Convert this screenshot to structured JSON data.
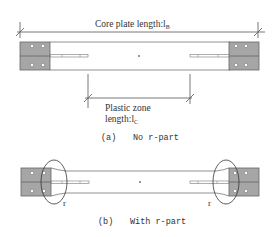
{
  "figure_a": {
    "dimension_top": {
      "label": "Core plate length:l",
      "subscript": "B"
    },
    "dimension_bottom": {
      "label_line1": "Plastic zone",
      "label_line2": "length:l",
      "subscript": "C"
    },
    "caption_letter": "(a)",
    "caption_text": "No r-part"
  },
  "figure_b": {
    "r_label_left": "r",
    "r_label_right": "r",
    "caption_letter": "(b)",
    "caption_text": "With r-part"
  },
  "colors": {
    "line": "#555555",
    "end_plate_fill": "#a6a6a6",
    "end_plate_stroke": "#666666",
    "text": "#333333",
    "background": "#ffffff"
  }
}
